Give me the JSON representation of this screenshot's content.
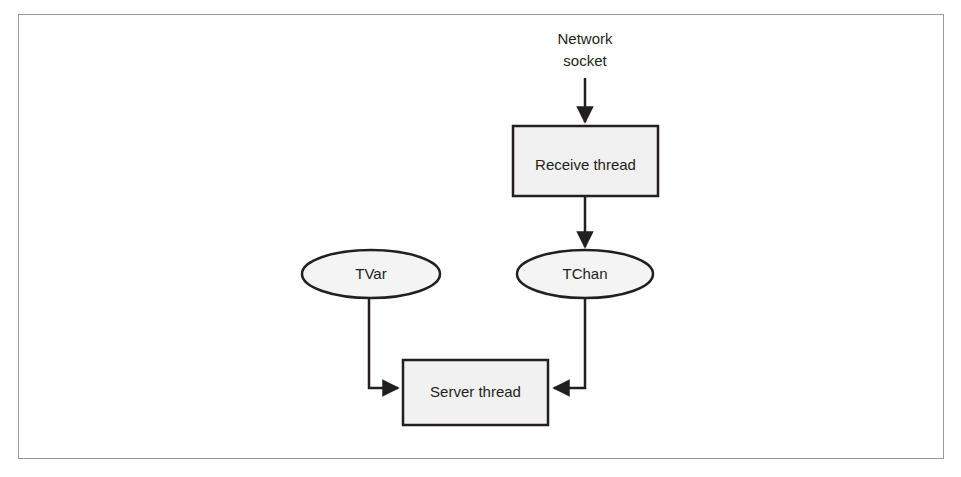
{
  "figure": {
    "frame": {
      "stroke": "#9a9a9a"
    },
    "style": {
      "box_fill": "#f1f1f1",
      "box_stroke": "#231f20",
      "ellipse_fill": "#f4f4f4",
      "ellipse_stroke": "#231f20",
      "connector_stroke": "#231f20",
      "text_color": "#231f20"
    },
    "labels": {
      "network_socket_line1": "Network",
      "network_socket_line2": "socket",
      "receive_thread": "Receive thread",
      "tvar": "TVar",
      "tchan": "TChan",
      "server_thread": "Server thread"
    },
    "nodes": [
      {
        "id": "network-socket",
        "kind": "text",
        "label": "Network socket"
      },
      {
        "id": "receive-thread",
        "kind": "rectangle",
        "label": "Receive thread"
      },
      {
        "id": "tvar",
        "kind": "ellipse",
        "label": "TVar"
      },
      {
        "id": "tchan",
        "kind": "ellipse",
        "label": "TChan"
      },
      {
        "id": "server-thread",
        "kind": "rectangle",
        "label": "Server thread"
      }
    ],
    "connectors": [
      {
        "id": "socket-to-receive",
        "from": "network-socket",
        "to": "receive-thread",
        "shape": "straight",
        "arrowhead": "end"
      },
      {
        "id": "receive-to-tchan",
        "from": "receive-thread",
        "to": "tchan",
        "shape": "straight",
        "arrowhead": "end"
      },
      {
        "id": "tvar-to-server",
        "from": "tvar",
        "to": "server-thread",
        "shape": "elbow",
        "arrowhead": "end"
      },
      {
        "id": "tchan-to-server",
        "from": "tchan",
        "to": "server-thread",
        "shape": "elbow",
        "arrowhead": "end"
      }
    ]
  }
}
